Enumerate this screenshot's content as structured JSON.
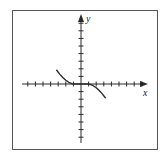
{
  "chart_data": {
    "type": "line",
    "title": "",
    "xlabel": "x",
    "ylabel": "y",
    "xlim": [
      -7.5,
      8.5
    ],
    "ylim": [
      -7.5,
      8.5
    ],
    "grid": false,
    "legend": null,
    "tick_spacing": 1,
    "tick_labels": false,
    "x_ticks": [
      -7,
      -6,
      -5,
      -4,
      -3,
      -2,
      -1,
      1,
      2,
      3,
      4,
      5,
      6,
      7,
      8
    ],
    "y_ticks": [
      -7,
      -6,
      -5,
      -4,
      -3,
      -2,
      -1,
      1,
      2,
      3,
      4,
      5,
      6,
      7,
      8
    ],
    "series": [
      {
        "name": "curve",
        "description": "decreasing cubic-like curve, flat along x-axis from x=-1 to x=1",
        "x": [
          -3.2,
          -2.8,
          -2.4,
          -2.0,
          -1.6,
          -1.2,
          -1.0,
          0.0,
          1.0,
          1.2,
          1.6,
          2.0,
          2.4,
          2.8,
          3.2
        ],
        "y": [
          1.8,
          1.3,
          0.85,
          0.5,
          0.22,
          0.05,
          0.0,
          0.0,
          0.0,
          -0.05,
          -0.22,
          -0.5,
          -0.85,
          -1.3,
          -1.8
        ]
      }
    ]
  },
  "labels": {
    "x_axis": "x",
    "y_axis": "y"
  },
  "colors": {
    "line": "#2a2a2a",
    "frame": "#555555",
    "background": "#ffffff"
  }
}
